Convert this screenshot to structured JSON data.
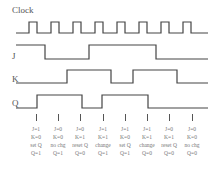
{
  "signals": {
    "clock": {
      "label": "Clock"
    },
    "j": {
      "label": "J"
    },
    "k": {
      "label": "K"
    },
    "q": {
      "label": "Q"
    }
  },
  "colors": {
    "wave": "#444444",
    "text": "#777777",
    "label": "#555555"
  },
  "columns": [
    {
      "j": "J=1",
      "k": "K=0",
      "action": "set Q",
      "q": "Q=1"
    },
    {
      "j": "J=0",
      "k": "K=0",
      "action": "no chg",
      "q": "Q=1"
    },
    {
      "j": "J=0",
      "k": "K=1",
      "action": "reset Q",
      "q": "Q=0"
    },
    {
      "j": "J=1",
      "k": "K=1",
      "action": "change",
      "q": "Q=1"
    },
    {
      "j": "J=1",
      "k": "K=0",
      "action": "set Q",
      "q": "Q=1"
    },
    {
      "j": "J=1",
      "k": "K=1",
      "action": "change",
      "q": "Q=0"
    },
    {
      "j": "J=0",
      "k": "K=1",
      "action": "reset Q",
      "q": "Q=0"
    },
    {
      "j": "J=0",
      "k": "K=0",
      "action": "no chg",
      "q": "Q=0"
    }
  ]
}
